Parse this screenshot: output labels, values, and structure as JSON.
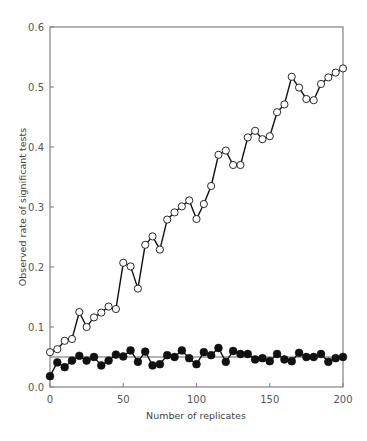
{
  "chart_data": {
    "type": "line",
    "title": "",
    "xlabel": "Number of replicates",
    "ylabel": "Observed rate of significant tests",
    "xlim": [
      0,
      200
    ],
    "ylim": [
      0.0,
      0.6
    ],
    "xticks": [
      0,
      50,
      100,
      150,
      200
    ],
    "yticks": [
      0.0,
      0.1,
      0.2,
      0.3,
      0.4,
      0.5,
      0.6
    ],
    "ytick_labels": [
      "0.0",
      "0.1",
      "0.2",
      "0.3",
      "0.4",
      "0.5",
      "0.6"
    ],
    "grid": false,
    "legend": null,
    "reference_line": {
      "y": 0.05,
      "color": "#999999"
    },
    "x": [
      0,
      5,
      10,
      15,
      20,
      25,
      30,
      35,
      40,
      45,
      50,
      55,
      60,
      65,
      70,
      75,
      80,
      85,
      90,
      95,
      100,
      105,
      110,
      115,
      120,
      125,
      130,
      135,
      140,
      145,
      150,
      155,
      160,
      165,
      170,
      175,
      180,
      185,
      190,
      195,
      200
    ],
    "series": [
      {
        "name": "open circles",
        "marker": "open",
        "values": [
          0.058,
          0.063,
          0.077,
          0.08,
          0.125,
          0.1,
          0.116,
          0.124,
          0.134,
          0.13,
          0.207,
          0.201,
          0.164,
          0.237,
          0.251,
          0.229,
          0.279,
          0.291,
          0.301,
          0.311,
          0.28,
          0.305,
          0.335,
          0.387,
          0.394,
          0.37,
          0.37,
          0.416,
          0.427,
          0.413,
          0.418,
          0.458,
          0.471,
          0.517,
          0.499,
          0.48,
          0.478,
          0.505,
          0.516,
          0.524,
          0.531
        ]
      },
      {
        "name": "filled circles",
        "marker": "filled",
        "values": [
          0.018,
          0.041,
          0.033,
          0.044,
          0.052,
          0.044,
          0.05,
          0.036,
          0.044,
          0.054,
          0.051,
          0.061,
          0.042,
          0.059,
          0.036,
          0.038,
          0.053,
          0.05,
          0.061,
          0.048,
          0.038,
          0.058,
          0.053,
          0.065,
          0.042,
          0.06,
          0.055,
          0.055,
          0.046,
          0.048,
          0.043,
          0.055,
          0.046,
          0.043,
          0.057,
          0.05,
          0.05,
          0.055,
          0.042,
          0.048,
          0.05
        ]
      }
    ]
  },
  "colors": {
    "frame": "#8a8a8a",
    "line": "#111111",
    "marker_fill_open": "#ffffff",
    "marker_fill_filled": "#111111"
  }
}
